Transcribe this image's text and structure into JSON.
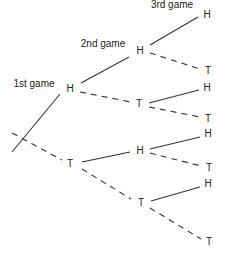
{
  "headers": {
    "game1": "1st game",
    "game2": "2nd game",
    "game3": "3rd game"
  },
  "tree": {
    "level1": [
      {
        "label": "H",
        "x": 70,
        "y": 89,
        "edge": "solid"
      },
      {
        "label": "T",
        "x": 70,
        "y": 164,
        "edge": "dashed"
      }
    ],
    "level2": [
      {
        "label": "H",
        "x": 140,
        "y": 51,
        "edge": "solid"
      },
      {
        "label": "T",
        "x": 139,
        "y": 104,
        "edge": "dashed"
      },
      {
        "label": "H",
        "x": 140,
        "y": 151,
        "edge": "solid"
      },
      {
        "label": "T",
        "x": 141,
        "y": 203,
        "edge": "dashed"
      }
    ],
    "level3": [
      {
        "label": "H",
        "x": 207,
        "y": 15,
        "edge": "solid"
      },
      {
        "label": "T",
        "x": 208,
        "y": 71,
        "edge": "dashed"
      },
      {
        "label": "H",
        "x": 207,
        "y": 88,
        "edge": "solid"
      },
      {
        "label": "T",
        "x": 208,
        "y": 119,
        "edge": "dashed"
      },
      {
        "label": "H",
        "x": 208,
        "y": 134,
        "edge": "solid"
      },
      {
        "label": "T",
        "x": 209,
        "y": 168,
        "edge": "dashed"
      },
      {
        "label": "H",
        "x": 208,
        "y": 184,
        "edge": "solid"
      },
      {
        "label": "T",
        "x": 209,
        "y": 242,
        "edge": "dashed"
      }
    ]
  }
}
